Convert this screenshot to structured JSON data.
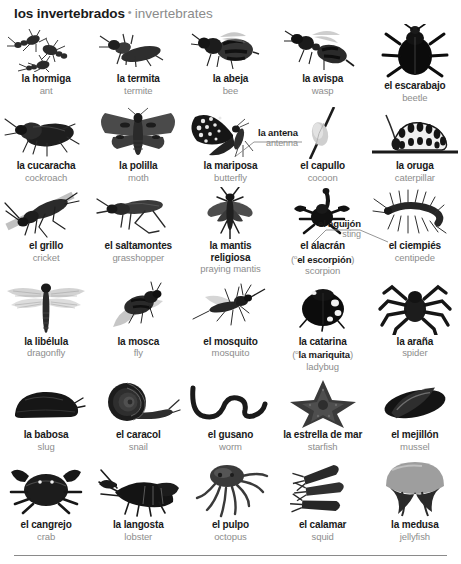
{
  "header": {
    "spanish": "los invertebrados",
    "separator": "•",
    "english": "invertebrates"
  },
  "callouts": {
    "antenna": {
      "spanish": "la antena",
      "english": "antenna"
    },
    "sting": {
      "spanish": "el aguijón",
      "english": "sting"
    }
  },
  "rows": [
    {
      "items": [
        {
          "spanish": "la hormiga",
          "english": "ant",
          "icon": "ant-photo"
        },
        {
          "spanish": "la termita",
          "english": "termite",
          "icon": "termite-photo"
        },
        {
          "spanish": "la abeja",
          "english": "bee",
          "icon": "bee-photo"
        },
        {
          "spanish": "la avispa",
          "english": "wasp",
          "icon": "wasp-photo"
        },
        {
          "spanish": "el escarabajo",
          "english": "beetle",
          "icon": "beetle-photo"
        }
      ]
    },
    {
      "items": [
        {
          "spanish": "la cucaracha",
          "english": "cockroach",
          "icon": "cockroach-photo"
        },
        {
          "spanish": "la polilla",
          "english": "moth",
          "icon": "moth-photo"
        },
        {
          "spanish": "la mariposa",
          "english": "butterfly",
          "icon": "butterfly-photo"
        },
        {
          "spanish": "el capullo",
          "english": "cocoon",
          "icon": "cocoon-photo"
        },
        {
          "spanish": "la oruga",
          "english": "caterpillar",
          "icon": "caterpillar-photo"
        }
      ]
    },
    {
      "items": [
        {
          "spanish": "el grillo",
          "english": "cricket",
          "icon": "cricket-photo"
        },
        {
          "spanish": "el saltamontes",
          "english": "grasshopper",
          "icon": "grasshopper-photo"
        },
        {
          "spanish": "la mantis religiosa",
          "english": "praying mantis",
          "icon": "praying-mantis-photo",
          "wrap": true
        },
        {
          "spanish": "el alacrán",
          "alt_prefix": "o",
          "alt_spanish": "el escorpión",
          "english": "scorpion",
          "icon": "scorpion-photo"
        },
        {
          "spanish": "el ciempiés",
          "english": "centipede",
          "icon": "centipede-photo"
        }
      ]
    },
    {
      "items": [
        {
          "spanish": "la libélula",
          "english": "dragonfly",
          "icon": "dragonfly-photo"
        },
        {
          "spanish": "la mosca",
          "english": "fly",
          "icon": "fly-photo"
        },
        {
          "spanish": "el mosquito",
          "english": "mosquito",
          "icon": "mosquito-photo"
        },
        {
          "spanish": "la catarina",
          "alt_prefix": "o",
          "alt_spanish": "la mariquita",
          "english": "ladybug",
          "icon": "ladybug-photo"
        },
        {
          "spanish": "la araña",
          "english": "spider",
          "icon": "spider-photo"
        }
      ]
    },
    {
      "items": [
        {
          "spanish": "la babosa",
          "english": "slug",
          "icon": "slug-photo"
        },
        {
          "spanish": "el caracol",
          "english": "snail",
          "icon": "snail-photo"
        },
        {
          "spanish": "el gusano",
          "english": "worm",
          "icon": "worm-photo"
        },
        {
          "spanish": "la estrella de mar",
          "english": "starfish",
          "icon": "starfish-photo"
        },
        {
          "spanish": "el mejillón",
          "english": "mussel",
          "icon": "mussel-photo"
        }
      ]
    },
    {
      "items": [
        {
          "spanish": "el cangrejo",
          "english": "crab",
          "icon": "crab-photo"
        },
        {
          "spanish": "la langosta",
          "english": "lobster",
          "icon": "lobster-photo"
        },
        {
          "spanish": "el pulpo",
          "english": "octopus",
          "icon": "octopus-photo"
        },
        {
          "spanish": "el calamar",
          "english": "squid",
          "icon": "squid-photo"
        },
        {
          "spanish": "la medusa",
          "english": "jellyfish",
          "icon": "jellyfish-photo"
        }
      ]
    }
  ]
}
